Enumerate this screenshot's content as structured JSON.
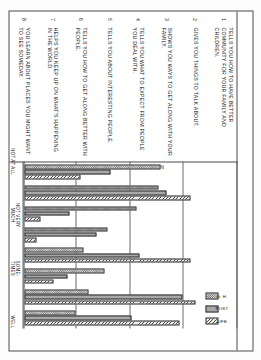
{
  "figure": {
    "title": "SOCIAL ORIENTATION",
    "orientation": "rotated-90",
    "questions": [
      {
        "num": "1",
        "text": "TELLS YOU HOW TO HAVE BETTER COMMUNITY FOR YOUR FAMILY AND CHILDREN."
      },
      {
        "num": "2",
        "text": "GIVES YOU THINGS TO TALK ABOUT."
      },
      {
        "num": "3",
        "text": "SHOWS YOU WAYS TO GET ALONG WITH YOUR FAMILY."
      },
      {
        "num": "4",
        "text": "TELLS YOU WHAT TO EXPECT FROM PEOPLE YOU DEAL WITH."
      },
      {
        "num": "5",
        "text": "TELLS YOU ABOUT INTERESTING PEOPLE."
      },
      {
        "num": "6",
        "text": "TELLS YOU HOW TO GET ALONG BETTER WITH PEOPLE."
      },
      {
        "num": "7",
        "text": "HELPS YOU KEEP UP ON WHAT'S HAPPENING IN THE WORLD."
      },
      {
        "num": "8",
        "text": "YOU LEARN ABOUT PLACES YOU MIGHT WANT TO SEE SOMEDAY."
      }
    ],
    "legend": [
      {
        "label": "G. H.",
        "key": "gh"
      },
      {
        "label": "POST",
        "key": "post"
      },
      {
        "label": "LIFE",
        "key": "life"
      }
    ]
  },
  "chart_data": {
    "type": "bar",
    "title": "SOCIAL ORIENTATION",
    "xlabel": "",
    "ylabel": "",
    "grid": true,
    "legend_position": "top-right",
    "axis_ticks": [
      {
        "value": 1,
        "label": "NOT AT ALL"
      },
      {
        "value": 2,
        "label": "NOT VERY MUCH"
      },
      {
        "value": 3,
        "label": "SOME- TIMES"
      },
      {
        "value": 4,
        "label": "WELL"
      },
      {
        "value": 5,
        "label": "QUITE WELL"
      }
    ],
    "ylim": [
      1,
      5
    ],
    "categories": [
      "TELLS YOU HOW TO HAVE BETTER COMMUNITY FOR YOUR FAMILY AND CHILDREN.",
      "GIVES YOU THINGS TO TALK ABOUT.",
      "SHOWS YOU WAYS TO GET ALONG WITH YOUR FAMILY.",
      "TELLS YOU WHAT TO EXPECT FROM PEOPLE YOU DEAL WITH.",
      "TELLS YOU ABOUT INTERESTING PEOPLE.",
      "TELLS YOU HOW TO GET ALONG BETTER WITH PEOPLE.",
      "HELPS YOU KEEP UP ON WHAT'S HAPPENING IN THE WORLD.",
      "YOU LEARN ABOUT PLACES YOU MIGHT WANT TO SEE SOMEDAY."
    ],
    "series": [
      {
        "name": "G. H.",
        "values": [
          3.55,
          3.5,
          3.1,
          2.55,
          2.1,
          2.5,
          2.2,
          1.95
        ]
      },
      {
        "name": "POST",
        "values": [
          2.6,
          3.65,
          1.85,
          2.35,
          3.15,
          1.8,
          3.95,
          3.0
        ]
      },
      {
        "name": "LIFE",
        "values": [
          2.05,
          4.1,
          1.3,
          1.22,
          4.1,
          1.55,
          4.2,
          3.9
        ]
      }
    ]
  }
}
